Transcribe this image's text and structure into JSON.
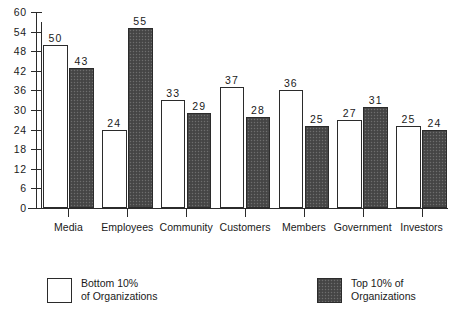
{
  "chart_data": {
    "type": "bar",
    "title": "",
    "subtitle": "",
    "xlabel": "",
    "ylabel": "",
    "ylim": [
      0,
      60
    ],
    "yticks": [
      0,
      6,
      12,
      18,
      24,
      30,
      36,
      42,
      48,
      54,
      60
    ],
    "ytick_labels": [
      "0",
      "6",
      "12",
      "18",
      "24",
      "30",
      "36",
      "42",
      "48",
      "54",
      "60"
    ],
    "grid": false,
    "legend_position": "bottom",
    "categories": [
      "Media",
      "Employees",
      "Community",
      "Customers",
      "Members",
      "Government",
      "Investors"
    ],
    "series": [
      {
        "name": "Bottom 10% of Organizations",
        "style": "light",
        "color": "#ffffff",
        "values": [
          50,
          24,
          33,
          37,
          36,
          27,
          25
        ]
      },
      {
        "name": "Top 10% of Organizations",
        "style": "dark",
        "color": "#4b4b4b",
        "values": [
          43,
          55,
          29,
          28,
          25,
          31,
          24
        ]
      }
    ],
    "data_labels": [
      [
        "50",
        "43"
      ],
      [
        "24",
        "55"
      ],
      [
        "33",
        "29"
      ],
      [
        "37",
        "28"
      ],
      [
        "36",
        "25"
      ],
      [
        "27",
        "31"
      ],
      [
        "25",
        "24"
      ]
    ]
  },
  "legend": {
    "left": {
      "swatch": "light",
      "line1": "Bottom 10%",
      "line2": "of Organizations"
    },
    "right": {
      "swatch": "dark",
      "line1": "Top 10% of",
      "line2": "Organizations"
    }
  },
  "colors": {
    "ink": "#1a1a1a",
    "axis": "#2b2b2b",
    "bar_light": "#ffffff",
    "bar_dark": "#4b4b4b",
    "background": "#ffffff"
  }
}
